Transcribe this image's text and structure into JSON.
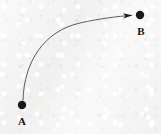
{
  "figure": {
    "background_color": "#f5f4f3",
    "ink_color": "#1a1a1a",
    "curve_color": "#4a4a4a",
    "width": 161,
    "height": 134
  },
  "nodes": [
    {
      "id": "A",
      "label": "A",
      "x": 22,
      "y": 105,
      "radius": 4.2,
      "label_x": 22,
      "label_y": 121,
      "role": "start-point"
    },
    {
      "id": "B",
      "label": "B",
      "x": 140,
      "y": 15,
      "radius": 4.2,
      "label_x": 141,
      "label_y": 31,
      "role": "end-point"
    }
  ],
  "edges": [
    {
      "id": "A-to-B",
      "from": "A",
      "to": "B",
      "kind": "curved-arrow",
      "directed": true,
      "arrowhead": "filled-triangle",
      "stroke_width": 0.9,
      "path": "M 23 100 C 24 62 44 31 80 23 C 100 18.5 118 16.3 131.5 15.4"
    }
  ],
  "chart_data": {
    "type": "diagram",
    "xlabel": "",
    "ylabel": "",
    "points": [
      {
        "name": "A",
        "x": 22,
        "y": 105
      },
      {
        "name": "B",
        "x": 140,
        "y": 15
      }
    ],
    "connections": [
      {
        "from": "A",
        "to": "B",
        "style": "curved",
        "arrow": "to-B"
      }
    ],
    "legend": [],
    "annotations": [
      "A",
      "B"
    ]
  }
}
